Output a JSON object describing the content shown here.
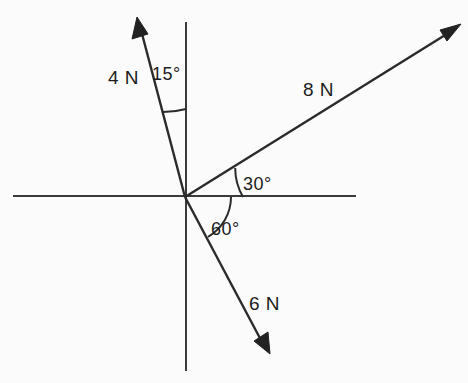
{
  "diagram": {
    "background_color": "#fbfbfb",
    "line_color": "#2b2b2b",
    "axis_color": "#3a3a3a",
    "origin": {
      "x": 185,
      "y": 197
    },
    "axes": {
      "horizontal": {
        "label": "x-axis",
        "x1": 13,
        "y1": 196,
        "x2": 356,
        "y2": 196
      },
      "vertical": {
        "label": "y-axis",
        "x1": 186,
        "y1": 22,
        "x2": 186,
        "y2": 371
      }
    },
    "vectors": [
      {
        "id": "force-4n",
        "label": "4 N",
        "magnitude": 4,
        "unit": "N",
        "angle_from_vertical_deg": 15,
        "angle_standard_deg": 105,
        "tip": {
          "x": 138,
          "y": 20
        },
        "label_pos": {
          "x": 108,
          "y": 84
        }
      },
      {
        "id": "force-8n",
        "label": "8 N",
        "magnitude": 8,
        "unit": "N",
        "angle_from_horizontal_deg": 30,
        "angle_standard_deg": 30,
        "tip": {
          "x": 459,
          "y": 26
        },
        "label_pos": {
          "x": 303,
          "y": 96
        }
      },
      {
        "id": "force-6n",
        "label": "6 N",
        "magnitude": 6,
        "unit": "N",
        "angle_from_horizontal_deg": -60,
        "angle_standard_deg": -60,
        "tip": {
          "x": 269,
          "y": 353
        },
        "label_pos": {
          "x": 249,
          "y": 310
        }
      }
    ],
    "angles": [
      {
        "id": "angle-15",
        "label": "15°",
        "value": 15,
        "between": [
          "force-4n",
          "y-axis-positive"
        ],
        "arc_radius": 88,
        "label_pos": {
          "x": 152,
          "y": 80
        }
      },
      {
        "id": "angle-30",
        "label": "30°",
        "value": 30,
        "between": [
          "force-8n",
          "x-axis-positive"
        ],
        "arc_radius": 58,
        "label_pos": {
          "x": 243,
          "y": 190
        }
      },
      {
        "id": "angle-60",
        "label": "60°",
        "value": 60,
        "between": [
          "x-axis-positive",
          "force-6n"
        ],
        "arc_radius": 46,
        "label_pos": {
          "x": 211,
          "y": 235
        }
      }
    ]
  }
}
